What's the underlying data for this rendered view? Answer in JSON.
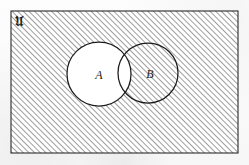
{
  "figure": {
    "kind": "venn-diagram",
    "universe_label": "𝔘",
    "universe_label_plain": "U",
    "background_color": "#fbfbfb",
    "ink_color": "#1b1b1b",
    "hatch_color": "#555555",
    "unshaded_fill": "#ffffff",
    "hatch_angle_degrees": 45,
    "hatch_spacing_px": 4,
    "rectangle": {
      "name": "universal-set",
      "x": 11,
      "y": 11,
      "width": 227,
      "height": 142,
      "shaded": true
    },
    "circles": [
      {
        "name": "set-a",
        "label": "A",
        "cx": 99,
        "cy": 74,
        "r": 32,
        "shaded": false,
        "label_x": 99,
        "label_y": 79
      },
      {
        "name": "set-b",
        "label": "B",
        "cx": 148,
        "cy": 73,
        "r": 30,
        "shaded": true,
        "label_x": 150,
        "label_y": 78
      }
    ],
    "regions": [
      {
        "name": "outside-a-and-b",
        "shaded": true
      },
      {
        "name": "a-only",
        "shaded": false
      },
      {
        "name": "a-intersect-b",
        "shaded": false
      },
      {
        "name": "b-only",
        "shaded": true
      }
    ]
  }
}
